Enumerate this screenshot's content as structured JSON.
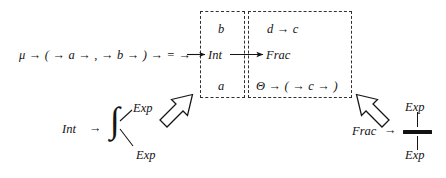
{
  "figure": {
    "type": "grammar-transformation-diagram",
    "background_color": "#ffffff",
    "ink_color": "#141414",
    "dashed_border_color": "#303030"
  },
  "rule": {
    "name": "mu-rule",
    "text": "μ → ( → a → , → b → ) → = →",
    "tokens": [
      "μ",
      "→",
      "(",
      "→",
      "a",
      "→",
      ",",
      "→",
      "b",
      "→",
      ")",
      "→",
      "=",
      "→"
    ]
  },
  "left_box": {
    "name": "int-context-box",
    "top_label": "b",
    "center_label": "Int",
    "bottom_label": "a"
  },
  "right_box": {
    "name": "frac-context-box",
    "top_label": "d → c",
    "center_label": "Frac",
    "bottom_label": "Θ → ( → c → )"
  },
  "center_arrow": {
    "name": "int-to-frac-arrow",
    "from": "Int",
    "to": "Frac"
  },
  "production_left": {
    "name": "int-production",
    "lhs": "Int",
    "arrow": "→",
    "operator_glyph": "∫",
    "operator_name": "integral-sign",
    "upper_operand": "Exp",
    "lower_operand": "Exp"
  },
  "production_right": {
    "name": "frac-production",
    "lhs": "Frac",
    "arrow": "→",
    "operator_glyph": "fraction-bar",
    "operator_name": "fraction-bar",
    "upper_operand": "Exp",
    "lower_operand": "Exp"
  },
  "block_arrows": [
    {
      "name": "left-block-arrow",
      "direction": "up-right",
      "points_to": "int-context-box",
      "style": "hollow-outline"
    },
    {
      "name": "right-block-arrow",
      "direction": "up-left",
      "points_to": "frac-context-box",
      "style": "hollow-outline"
    }
  ]
}
